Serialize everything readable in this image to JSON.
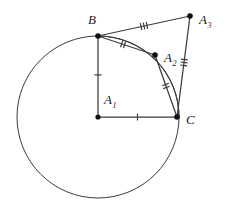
{
  "figure": {
    "type": "geometry-diagram",
    "background_color": "#ffffff",
    "stroke_color": "#3c3c3c",
    "point_color": "#111111",
    "label_color": "#1a1a1a",
    "width": 225,
    "height": 211
  },
  "circle": {
    "name": "main-circle",
    "center_x": 98,
    "center_y": 117,
    "radius": 81,
    "stroke_width": 1
  },
  "points": [
    {
      "id": "A1",
      "label": "A",
      "subscript": "1",
      "x": 98,
      "y": 117,
      "label_x": 104,
      "label_y": 104,
      "dot": true,
      "dot_r": 2.6
    },
    {
      "id": "B",
      "label": "B",
      "subscript": "",
      "x": 98,
      "y": 36,
      "label_x": 88,
      "label_y": 24,
      "dot": true,
      "dot_r": 2.8
    },
    {
      "id": "A2",
      "label": "A",
      "subscript": "2",
      "x": 155,
      "y": 55,
      "label_x": 164,
      "label_y": 62,
      "dot": true,
      "dot_r": 2.8
    },
    {
      "id": "A3",
      "label": "A",
      "subscript": "3",
      "x": 190,
      "y": 16,
      "label_x": 199,
      "label_y": 24,
      "dot": true,
      "dot_r": 2.8
    },
    {
      "id": "C",
      "label": "C",
      "subscript": "",
      "x": 177,
      "y": 117,
      "label_x": 186,
      "label_y": 124,
      "dot": true,
      "dot_r": 2.8
    }
  ],
  "segments": [
    {
      "id": "A1-B",
      "from": "A1",
      "to": "B",
      "x1": 98,
      "y1": 117,
      "x2": 98,
      "y2": 36,
      "ticks": 1,
      "tick_t": 0.52
    },
    {
      "id": "A1-C",
      "from": "A1",
      "to": "C",
      "x1": 98,
      "y1": 117,
      "x2": 177,
      "y2": 117,
      "ticks": 1,
      "tick_t": 0.5
    },
    {
      "id": "B-A2",
      "from": "B",
      "to": "A2",
      "x1": 98,
      "y1": 36,
      "x2": 155,
      "y2": 55,
      "ticks": 2,
      "tick_t": 0.44
    },
    {
      "id": "A2-C",
      "from": "A2",
      "to": "C",
      "x1": 155,
      "y1": 55,
      "x2": 177,
      "y2": 117,
      "ticks": 2,
      "tick_t": 0.5
    },
    {
      "id": "B-A3",
      "from": "B",
      "to": "A3",
      "x1": 98,
      "y1": 36,
      "x2": 190,
      "y2": 16,
      "ticks": 3,
      "tick_t": 0.5
    },
    {
      "id": "A3-C",
      "from": "A3",
      "to": "C",
      "x1": 190,
      "y1": 16,
      "x2": 177,
      "y2": 117,
      "ticks": 3,
      "tick_t": 0.46
    }
  ],
  "arcs": [
    {
      "id": "arc-B-C",
      "from": "B",
      "to": "C",
      "center_x": 98,
      "center_y": 117,
      "radius": 81,
      "start_angle_deg": 90,
      "end_angle_deg": 0
    }
  ],
  "tick_style": {
    "length": 7,
    "spacing": 3,
    "stroke_width": 1.2
  }
}
